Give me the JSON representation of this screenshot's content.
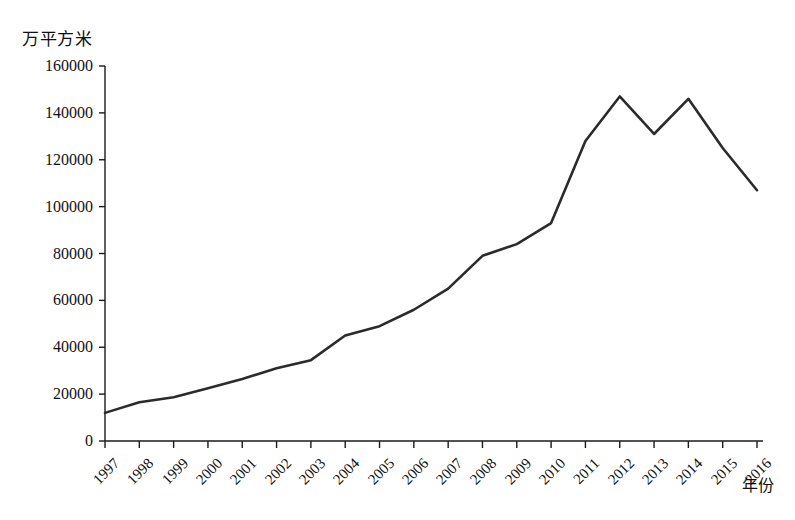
{
  "chart_data": {
    "type": "line",
    "title": "",
    "subtitle": "",
    "unit_label": "万平方米",
    "xlabel": "年份",
    "ylabel": "",
    "grid": false,
    "legend": "none",
    "xlim": [
      1997,
      2016
    ],
    "ylim": [
      0,
      160000
    ],
    "ytick_values": [
      0,
      20000,
      40000,
      60000,
      80000,
      100000,
      120000,
      140000,
      160000
    ],
    "ytick_labels": [
      "0",
      "20000",
      "40000",
      "60000",
      "80000",
      "100000",
      "120000",
      "140000",
      "160000"
    ],
    "categories": [
      "1997",
      "1998",
      "1999",
      "2000",
      "2001",
      "2002",
      "2003",
      "2004",
      "2005",
      "2006",
      "2007",
      "2008",
      "2009",
      "2010",
      "2011",
      "2012",
      "2013",
      "2014",
      "2015",
      "2016"
    ],
    "x": [
      1997,
      1998,
      1999,
      2000,
      2001,
      2002,
      2003,
      2004,
      2005,
      2006,
      2007,
      2008,
      2009,
      2010,
      2011,
      2012,
      2013,
      2014,
      2015,
      2016
    ],
    "values": [
      12000,
      16500,
      18700,
      22500,
      26500,
      31000,
      34500,
      45000,
      49000,
      56000,
      65000,
      79000,
      84000,
      93000,
      128000,
      147000,
      131000,
      146000,
      125000,
      107000
    ],
    "series": [
      {
        "name": "销售面积",
        "color": "#2b2b2b",
        "values": [
          12000,
          16500,
          18700,
          22500,
          26500,
          31000,
          34500,
          45000,
          49000,
          56000,
          65000,
          79000,
          84000,
          93000,
          128000,
          147000,
          131000,
          146000,
          125000,
          107000
        ]
      }
    ],
    "line_color": "#2b2b2b",
    "line_width": 2.6,
    "axis_color": "#1a1a1a"
  },
  "axes": {
    "unit_label": "万平方米",
    "x_title": "年份"
  }
}
